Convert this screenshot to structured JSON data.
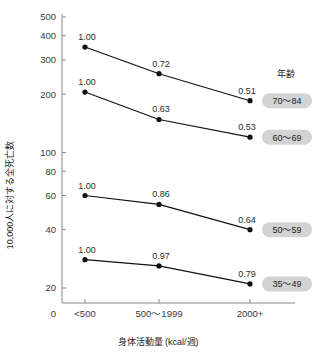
{
  "chart_data": {
    "type": "line",
    "title": "",
    "xlabel": "身体活動量 (kcal/週)",
    "ylabel": "10,000人に対する全死亡数",
    "yscale": "log",
    "ylim": [
      18,
      560
    ],
    "grid": false,
    "legend_position": "right",
    "legend_title": "年齢",
    "categories": [
      "<500",
      "500〜1999",
      "2000+"
    ],
    "origin_tick_label": "0",
    "ytick_labels": [
      "20",
      "40",
      "60",
      "80",
      "100",
      "200",
      "300",
      "400",
      "500"
    ],
    "yticks": [
      20,
      40,
      60,
      80,
      100,
      200,
      300,
      400,
      500
    ],
    "series": [
      {
        "name": "70〜84",
        "values": [
          350,
          255,
          185
        ],
        "point_labels": [
          "1.00",
          "0.72",
          "0.51"
        ]
      },
      {
        "name": "60〜69",
        "values": [
          205,
          148,
          120
        ],
        "point_labels": [
          "1.00",
          "0.63",
          "0.53"
        ]
      },
      {
        "name": "50〜59",
        "values": [
          60,
          54,
          40
        ],
        "point_labels": [
          "1.00",
          "0.86",
          "0.64"
        ]
      },
      {
        "name": "35〜49",
        "values": [
          28,
          26,
          21
        ],
        "point_labels": [
          "1.00",
          "0.97",
          "0.79"
        ]
      }
    ],
    "colors": {
      "line": "#111111",
      "marker": "#111111",
      "axis": "#8a8a8a",
      "badge_bg": "#d3d3d3",
      "text": "#1a1a1a"
    }
  }
}
